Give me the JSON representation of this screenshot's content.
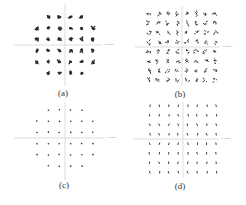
{
  "figure": {
    "panels": [
      {
        "id": "a",
        "caption": "(a)",
        "axis_label": "In-Phase"
      },
      {
        "id": "b",
        "caption": "(b)",
        "axis_label": "In-Phase"
      },
      {
        "id": "c",
        "caption": "(c)",
        "axis_label": "In-Phase"
      },
      {
        "id": "d",
        "caption": "(d)",
        "axis_label": "In-Phase"
      }
    ]
  },
  "chart_data": [
    {
      "type": "scatter",
      "title": "(a)",
      "description": "32-QAM cross constellation, noisy (large clusters)",
      "grid_rows": [
        4,
        6,
        6,
        6,
        6,
        4
      ],
      "levels": [
        -5,
        -3,
        -1,
        1,
        3,
        5
      ],
      "spread": "high",
      "xlabel": "In-Phase",
      "ylabel": "",
      "grid": false,
      "axes_through_origin": true
    },
    {
      "type": "scatter",
      "title": "(b)",
      "description": "64-QAM square constellation, noisy (scribbled clusters)",
      "grid_rows": [
        8,
        8,
        8,
        8,
        8,
        8,
        8,
        8
      ],
      "levels": [
        -7,
        -5,
        -3,
        -1,
        1,
        3,
        5,
        7
      ],
      "spread": "high",
      "xlabel": "In-Phase",
      "ylabel": "",
      "grid": false,
      "axes_through_origin": true
    },
    {
      "type": "scatter",
      "title": "(c)",
      "description": "32-QAM cross constellation, compensated (tight points)",
      "grid_rows": [
        4,
        6,
        6,
        6,
        6,
        4
      ],
      "levels": [
        -5,
        -3,
        -1,
        1,
        3,
        5
      ],
      "spread": "low",
      "xlabel": "In-Phase",
      "ylabel": "",
      "grid": false,
      "axes_through_origin": true
    },
    {
      "type": "scatter",
      "title": "(d)",
      "description": "64-QAM square constellation, compensated (tight points)",
      "grid_rows": [
        8,
        8,
        8,
        8,
        8,
        8,
        8,
        8
      ],
      "levels": [
        -7,
        -5,
        -3,
        -1,
        1,
        3,
        5,
        7
      ],
      "spread": "low",
      "xlabel": "In-Phase",
      "ylabel": "",
      "grid": false,
      "axes_through_origin": true
    }
  ],
  "layout": {
    "panels": [
      {
        "cx": 65,
        "cy": 45,
        "step": 5.6,
        "ax_left": 14,
        "ax_right": 102,
        "ax_top": 4,
        "ax_bottom": 86,
        "cap_x": 63,
        "cap_y": 88,
        "label_x": 104,
        "label_y": 43
      },
      {
        "cx": 182,
        "cy": 47,
        "step": 4.75,
        "ax_left": 135,
        "ax_right": 220,
        "ax_top": 6,
        "ax_bottom": 86,
        "cap_x": 180,
        "cap_y": 89,
        "label_x": 222,
        "label_y": 45
      },
      {
        "cx": 65,
        "cy": 138,
        "step": 5.6,
        "ax_left": 14,
        "ax_right": 104,
        "ax_top": 102,
        "ax_bottom": 180,
        "cap_x": 64,
        "cap_y": 180,
        "label_x": 106,
        "label_y": 136
      },
      {
        "cx": 183,
        "cy": 139,
        "step": 4.75,
        "ax_left": 133,
        "ax_right": 219,
        "ax_top": 102,
        "ax_bottom": 178,
        "cap_x": 180,
        "cap_y": 181,
        "label_x": 221,
        "label_y": 137
      }
    ],
    "colors": {
      "points": "#2a2a2a",
      "axis": "#cfcfcf",
      "caption": "#333333"
    }
  }
}
